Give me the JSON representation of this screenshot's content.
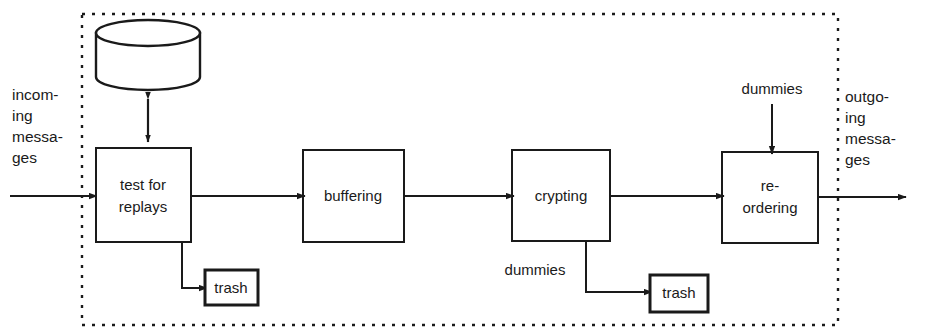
{
  "diagram": {
    "boundary": {
      "name": "mix-node-boundary",
      "style": "dotted-rectangle"
    },
    "colors": {
      "stroke": "#1a1a1a",
      "fill": "#ffffff",
      "background": "#ffffff"
    },
    "io": {
      "input_label_lines": [
        "incom-",
        "ing",
        "messa-",
        "ges"
      ],
      "input_label_text": "incoming messages",
      "output_label_lines": [
        "outgo-",
        "ing",
        "messa-",
        "ges"
      ],
      "output_label_text": "outgoing messages"
    },
    "store": {
      "name": "replay-database",
      "label": ""
    },
    "nodes": [
      {
        "id": "test-for-replays",
        "label_lines": [
          "test   for",
          "replays"
        ],
        "label": "test for replays"
      },
      {
        "id": "buffering",
        "label_lines": [
          "buffering"
        ],
        "label": "buffering"
      },
      {
        "id": "crypting",
        "label_lines": [
          "crypting"
        ],
        "label": "crypting"
      },
      {
        "id": "re-ordering",
        "label_lines": [
          "re-",
          "ordering"
        ],
        "label": "re-ordering"
      }
    ],
    "sinks": [
      {
        "id": "trash-replays",
        "label": "trash"
      },
      {
        "id": "trash-dummies",
        "label": "trash"
      }
    ],
    "edge_labels": [
      {
        "id": "dummies-in",
        "label": "dummies"
      },
      {
        "id": "dummies-out",
        "label": "dummies"
      }
    ]
  }
}
